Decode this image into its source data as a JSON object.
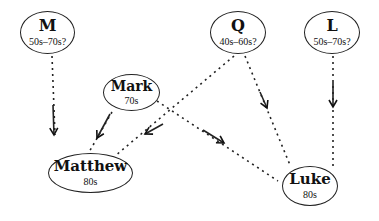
{
  "diagram": {
    "type": "source-dependency",
    "nodes": [
      {
        "id": "M",
        "name": "M",
        "date": "50s–70s?"
      },
      {
        "id": "Q",
        "name": "Q",
        "date": "40s–60s?"
      },
      {
        "id": "L",
        "name": "L",
        "date": "50s–70s?"
      },
      {
        "id": "Mark",
        "name": "Mark",
        "date": "70s"
      },
      {
        "id": "Matthew",
        "name": "Matthew",
        "date": "80s"
      },
      {
        "id": "Luke",
        "name": "Luke",
        "date": "80s"
      }
    ],
    "edges": [
      {
        "from": "M",
        "to": "Matthew",
        "style": "dashed-arrow"
      },
      {
        "from": "Mark",
        "to": "Matthew",
        "style": "dashed-arrow"
      },
      {
        "from": "Q",
        "to": "Matthew",
        "style": "dashed-arrow"
      },
      {
        "from": "Mark",
        "to": "Luke",
        "style": "dashed-arrow"
      },
      {
        "from": "Q",
        "to": "Luke",
        "style": "dashed-arrow"
      },
      {
        "from": "L",
        "to": "Luke",
        "style": "dashed-arrow"
      }
    ]
  }
}
